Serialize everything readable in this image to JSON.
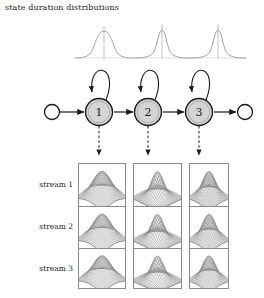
{
  "figure": {
    "title": "state duration distributions",
    "ink_color": "#1a1a1a",
    "state_fill": "#d4d4d4",
    "surface_color": "#8c8c8c",
    "box_border": "#8a8a8a"
  },
  "duration_distributions": [
    {
      "state": "1",
      "shape": "gaussian",
      "relative_width": "wide",
      "name": "duration-curve-state-1"
    },
    {
      "state": "2",
      "shape": "gaussian",
      "relative_width": "narrow",
      "name": "duration-curve-state-2"
    },
    {
      "state": "3",
      "shape": "gaussian",
      "relative_width": "narrow",
      "name": "duration-curve-state-3"
    }
  ],
  "state_machine": {
    "entry_node": {
      "label": "",
      "type": "open-circle"
    },
    "exit_node": {
      "label": "",
      "type": "open-circle"
    },
    "states": [
      {
        "label": "1",
        "self_loop": true,
        "emits": true
      },
      {
        "label": "2",
        "self_loop": true,
        "emits": true
      },
      {
        "label": "3",
        "self_loop": true,
        "emits": true
      }
    ],
    "transition_style": "solid-arrow",
    "emission_style": "dashed-arrow"
  },
  "streams": [
    {
      "label": "stream 1"
    },
    {
      "label": "stream 2"
    },
    {
      "label": "stream 3"
    }
  ],
  "observation_grid": {
    "columns": 3,
    "rows": 3,
    "cell_plot_type": "3d-gaussian-surface",
    "cells": [
      [
        {
          "peak": "wide"
        },
        {
          "peak": "narrow"
        },
        {
          "peak": "medium"
        }
      ],
      [
        {
          "peak": "wide"
        },
        {
          "peak": "narrow"
        },
        {
          "peak": "medium"
        }
      ],
      [
        {
          "peak": "wide"
        },
        {
          "peak": "narrow"
        },
        {
          "peak": "medium"
        }
      ]
    ]
  },
  "chart_data": {
    "type": "line",
    "title": "state duration distributions",
    "xlabel": "",
    "ylabel": "",
    "grid": false,
    "legend": "none",
    "series": [
      {
        "name": "state 1 duration pdf",
        "shape": "gaussian",
        "mean": 0.5,
        "sigma": 0.175,
        "peak": 1.0
      },
      {
        "name": "state 2 duration pdf",
        "shape": "gaussian",
        "mean": 0.5,
        "sigma": 0.125,
        "peak": 1.0
      },
      {
        "name": "state 3 duration pdf",
        "shape": "gaussian",
        "mean": 0.5,
        "sigma": 0.12,
        "peak": 1.0
      }
    ],
    "surfaces": [
      {
        "name": "state 1 / stream 1",
        "sigma_x": 0.2,
        "sigma_y": 0.2
      },
      {
        "name": "state 2 / stream 1",
        "sigma_x": 0.13,
        "sigma_y": 0.13
      },
      {
        "name": "state 3 / stream 1",
        "sigma_x": 0.17,
        "sigma_y": 0.17
      },
      {
        "name": "state 1 / stream 2",
        "sigma_x": 0.2,
        "sigma_y": 0.2
      },
      {
        "name": "state 2 / stream 2",
        "sigma_x": 0.13,
        "sigma_y": 0.13
      },
      {
        "name": "state 3 / stream 2",
        "sigma_x": 0.17,
        "sigma_y": 0.17
      },
      {
        "name": "state 1 / stream 3",
        "sigma_x": 0.2,
        "sigma_y": 0.2
      },
      {
        "name": "state 2 / stream 3",
        "sigma_x": 0.13,
        "sigma_y": 0.13
      },
      {
        "name": "state 3 / stream 3",
        "sigma_x": 0.17,
        "sigma_y": 0.17
      }
    ]
  }
}
